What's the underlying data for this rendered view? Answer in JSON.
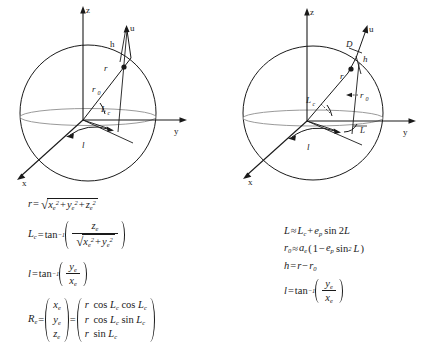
{
  "figure": {
    "background": "#ffffff",
    "ink": "#1a1a1a",
    "ellipse_color": "#9a9a9a"
  },
  "panels": [
    {
      "id": "left",
      "name": "geocentric-spherical-diagram",
      "axes": {
        "x": "x",
        "y": "y",
        "z": "z"
      },
      "labels": {
        "u": "u",
        "h": "h",
        "r": "r",
        "r0": "r",
        "r0_sub": "0",
        "Lc": "L",
        "Lc_sub": "c",
        "l": "l"
      },
      "equations": [
        {
          "name": "radius-equation",
          "lhs": "r",
          "relation": "=",
          "rhs_text": "sqrt(xe^2 + ye^2 + ze^2)"
        },
        {
          "name": "geocentric-latitude-equation",
          "lhs": "Lc",
          "relation": "=",
          "rhs_text": "tan^-1( ze / sqrt(xe^2 + ye^2) )"
        },
        {
          "name": "longitude-equation",
          "lhs": "l",
          "relation": "=",
          "rhs_text": "tan^-1( ye / xe )"
        },
        {
          "name": "position-vector-equation",
          "lhs": "Re",
          "relation": "=",
          "vector_left": [
            "x",
            "y",
            "z"
          ],
          "vector_left_sub": "e",
          "relation2": "=",
          "vector_right": [
            "r cos Lc cos Lc",
            "r cos Lc sin Lc",
            "r sin Lc"
          ]
        }
      ]
    },
    {
      "id": "right",
      "name": "geodetic-ellipsoidal-diagram",
      "axes": {
        "x": "x",
        "y": "y",
        "z": "z"
      },
      "labels": {
        "u": "u",
        "D": "D",
        "h": "h",
        "r": "r",
        "r0": "r",
        "r0_sub": "0",
        "Lc": "L",
        "Lc_sub": "c",
        "L": "L",
        "l": "l"
      },
      "equations": [
        {
          "name": "geodetic-latitude-equation",
          "lhs": "L",
          "relation": "≈",
          "rhs_text": "Lc + ep sin 2L"
        },
        {
          "name": "ellipsoid-radius-equation",
          "lhs": "r0",
          "relation": "≈",
          "rhs_text": "ae(1 - ep sin^2 L)"
        },
        {
          "name": "altitude-equation",
          "lhs": "h",
          "relation": "=",
          "rhs_text": "r - r0"
        },
        {
          "name": "longitude-equation",
          "lhs": "l",
          "relation": "=",
          "rhs_text": "tan^-1( ye / xe )"
        }
      ]
    }
  ],
  "symbols": {
    "equals": "=",
    "approx": "≈",
    "plus": "+",
    "minus": "−",
    "radical": "√",
    "tan": "tan",
    "cos": "cos",
    "sin": "sin",
    "inverse_exp": "−1",
    "two": "2",
    "subscript_e": "e",
    "subscript_c": "c",
    "subscript_0": "0",
    "subscript_p": "p",
    "var_r": "r",
    "var_h": "h",
    "var_l": "l",
    "var_L": "L",
    "var_D": "D",
    "var_u": "u",
    "var_x": "x",
    "var_y": "y",
    "var_z": "z",
    "var_a": "a",
    "var_e": "e",
    "var_R": "R"
  }
}
